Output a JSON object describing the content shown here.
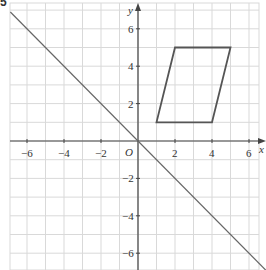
{
  "question_number": "5",
  "chart_data": {
    "type": "line",
    "title": "",
    "xlabel": "x",
    "ylabel": "y",
    "origin_label": "O",
    "xlim": [
      -6.9,
      6.5
    ],
    "ylim": [
      -6.9,
      7.3
    ],
    "grid": true,
    "x_ticks": [
      -6,
      -4,
      -2,
      2,
      4,
      6
    ],
    "y_ticks": [
      6,
      4,
      2,
      -2,
      -4,
      -6
    ],
    "x_tick_labels": [
      "−6",
      "−4",
      "−2",
      "2",
      "4",
      "6"
    ],
    "y_tick_labels": [
      "6",
      "4",
      "2",
      "−2",
      "−4",
      "−6"
    ],
    "series": [
      {
        "name": "line y = -x",
        "type": "line",
        "points": [
          [
            -6.9,
            6.9
          ],
          [
            6.9,
            -6.9
          ]
        ]
      },
      {
        "name": "parallelogram",
        "type": "polygon",
        "points": [
          [
            1,
            1
          ],
          [
            4,
            1
          ],
          [
            5,
            5
          ],
          [
            2,
            5
          ]
        ]
      }
    ]
  },
  "colors": {
    "grid": "#d9d9d9",
    "axis": "#444444",
    "shape": "#555555",
    "line": "#666666"
  }
}
